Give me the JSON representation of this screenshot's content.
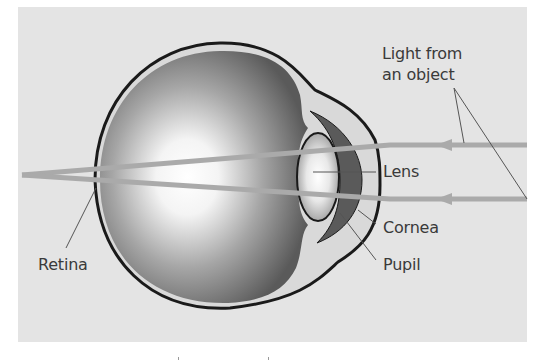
{
  "diagram": {
    "type": "eye-cross-section",
    "colors": {
      "background_panel": "#e4e4e4",
      "page": "#ffffff",
      "eye_outline": "#1a1a1a",
      "sclera_inner": "#d9d9d9",
      "vitreous_dark": "#5e5e5e",
      "vitreous_light": "#ffffff",
      "iris_cornea_fill": "#5a5a5a",
      "light_ray": "#aaaaaa",
      "leader_line": "#555555",
      "label_text": "#3a3a3a"
    },
    "labels": {
      "light_source": [
        "Light from",
        "an object"
      ],
      "lens": "Lens",
      "cornea": "Cornea",
      "pupil": "Pupil",
      "retina": "Retina"
    },
    "rays": [
      {
        "name": "upper-ray",
        "from": [
          527,
          145
        ],
        "to": [
          22,
          175
        ]
      },
      {
        "name": "lower-ray",
        "from": [
          527,
          199
        ],
        "to": [
          22,
          175
        ]
      }
    ]
  }
}
